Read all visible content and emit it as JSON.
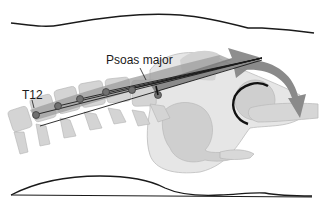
{
  "figure": {
    "labels": {
      "muscle": "Psoas major",
      "vertebra": "T12"
    },
    "colors": {
      "background": "#ffffff",
      "outline": "#1a1a1a",
      "bone_light": "#d9d9d9",
      "bone_mid": "#c4c4c4",
      "pelvis_fill": "#e4e4e4",
      "muscle_band": "#9a9a9a",
      "arrow_dark": "#6e6e6e",
      "attachment_dot": "#707070"
    },
    "attachment_points": 6
  }
}
